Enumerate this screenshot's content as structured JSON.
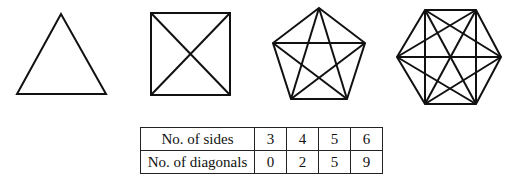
{
  "figure": {
    "shapes": [
      {
        "name": "triangle",
        "sides": 3,
        "diagonals": 0
      },
      {
        "name": "square",
        "sides": 4,
        "diagonals": 2
      },
      {
        "name": "pentagon",
        "sides": 5,
        "diagonals": 5
      },
      {
        "name": "hexagon",
        "sides": 6,
        "diagonals": 9
      }
    ]
  },
  "table": {
    "rows": [
      {
        "label": "No. of sides",
        "values": [
          "3",
          "4",
          "5",
          "6"
        ]
      },
      {
        "label": "No. of diagonals",
        "values": [
          "0",
          "2",
          "5",
          "9"
        ]
      }
    ]
  }
}
